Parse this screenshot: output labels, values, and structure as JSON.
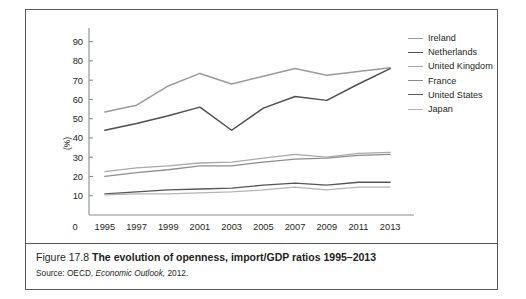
{
  "caption": {
    "figure_number": "Figure 17.8",
    "title": "The evolution of openness, import/GDP ratios 1995–2013",
    "source_prefix": "Source: OECD,",
    "source_italic": "Economic Outlook,",
    "source_year": "2012."
  },
  "legend": {
    "position": "right",
    "items": [
      {
        "label": "Ireland",
        "color": "#9a9a9d"
      },
      {
        "label": "Netherlands",
        "color": "#4f4f52"
      },
      {
        "label": "United Kingdom",
        "color": "#a9a9ac"
      },
      {
        "label": "France",
        "color": "#8e8e91"
      },
      {
        "label": "United States",
        "color": "#55555a"
      },
      {
        "label": "Japan",
        "color": "#b4b4b7"
      }
    ]
  },
  "chart_data": {
    "type": "line",
    "title": "The evolution of openness, import/GDP ratios 1995–2013",
    "xlabel": "",
    "ylabel": "(%)",
    "x": [
      1995,
      1997,
      1999,
      2001,
      2003,
      2005,
      2007,
      2009,
      2011,
      2013
    ],
    "xtick_labels": [
      "0",
      "1995",
      "1997",
      "1999",
      "2001",
      "2003",
      "2005",
      "2007",
      "2009",
      "2011",
      "2013"
    ],
    "ytick_labels": [
      "10",
      "20",
      "30",
      "40",
      "50",
      "60",
      "70",
      "80",
      "90"
    ],
    "xlim": [
      1994,
      2014
    ],
    "ylim": [
      0,
      95
    ],
    "grid": false,
    "series": [
      {
        "name": "Ireland",
        "color": "#9a9a9d",
        "width": 1.5,
        "values": [
          53.5,
          57.0,
          67.0,
          73.5,
          68.0,
          72.0,
          76.0,
          72.5,
          74.5,
          76.5
        ]
      },
      {
        "name": "Netherlands",
        "color": "#4f4f52",
        "width": 1.5,
        "values": [
          44.0,
          47.5,
          51.5,
          56.0,
          44.0,
          55.5,
          61.5,
          59.5,
          68.0,
          76.0
        ]
      },
      {
        "name": "United Kingdom",
        "color": "#a9a9ac",
        "width": 1.3,
        "values": [
          22.5,
          24.5,
          25.5,
          27.0,
          27.5,
          29.5,
          31.5,
          30.0,
          32.0,
          32.5
        ]
      },
      {
        "name": "France",
        "color": "#8e8e91",
        "width": 1.3,
        "values": [
          20.0,
          22.0,
          23.5,
          25.5,
          25.5,
          27.5,
          29.0,
          29.5,
          31.0,
          31.5
        ]
      },
      {
        "name": "United States",
        "color": "#55555a",
        "width": 1.3,
        "values": [
          11.0,
          12.0,
          13.0,
          13.5,
          14.0,
          15.5,
          16.5,
          15.5,
          17.0,
          17.0
        ]
      },
      {
        "name": "Japan",
        "color": "#b4b4b7",
        "width": 1.3,
        "values": [
          10.5,
          11.0,
          11.0,
          11.5,
          12.0,
          13.0,
          14.5,
          13.0,
          14.5,
          14.5
        ]
      }
    ]
  }
}
